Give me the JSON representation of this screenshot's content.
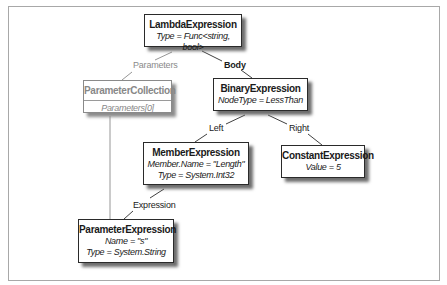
{
  "diagram": {
    "type": "expression-tree",
    "frame": {
      "x": 8,
      "y": 6,
      "width": 432,
      "height": 275,
      "border_color": "#a8a8a8"
    },
    "colors": {
      "node_border": "#2a2a2a",
      "muted_text": "#888888",
      "edge": "#2a2a2a",
      "muted_edge": "#8a8a8a",
      "shadow": "#6e6e6e"
    },
    "nodes": {
      "lambda": {
        "title": "LambdaExpression",
        "props": [
          "Type = Func<string, bool>"
        ]
      },
      "parameter_collection": {
        "title": "ParameterCollection",
        "props": [
          "Parameters[0]"
        ],
        "muted": true
      },
      "binary": {
        "title": "BinaryExpression",
        "props": [
          "NodeType = LessThan"
        ]
      },
      "member": {
        "title": "MemberExpression",
        "props": [
          "Member.Name = \"Length\"",
          "Type = System.Int32"
        ]
      },
      "constant": {
        "title": "ConstantExpression",
        "props": [
          "Value = 5"
        ]
      },
      "parameter": {
        "title": "ParameterExpression",
        "props": [
          "Name = \"s\"",
          "Type = System.String"
        ]
      }
    },
    "edges": [
      {
        "from": "lambda",
        "to": "parameter_collection",
        "label": "Parameters",
        "muted": true
      },
      {
        "from": "lambda",
        "to": "binary",
        "label": "Body"
      },
      {
        "from": "binary",
        "to": "member",
        "label": "Left"
      },
      {
        "from": "binary",
        "to": "constant",
        "label": "Right"
      },
      {
        "from": "member",
        "to": "parameter",
        "label": "Expression"
      },
      {
        "from": "parameter_collection",
        "to": "parameter",
        "label": "",
        "muted": true
      }
    ]
  }
}
